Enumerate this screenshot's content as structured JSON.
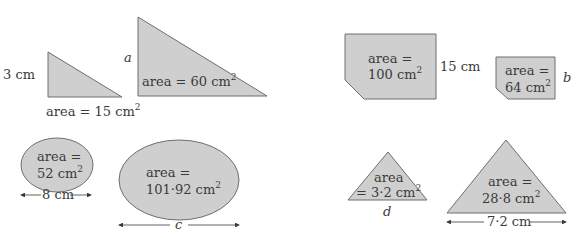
{
  "colors": {
    "fill": "#cfcfcf",
    "stroke": "#6e6e6e",
    "text": "#3a3a3a"
  },
  "shapes": {
    "tri_small": {
      "side_label": "3 cm",
      "area_label": "area = 15 cm",
      "sup": "2"
    },
    "tri_large": {
      "side_label": "a",
      "area_label": "area = 60 cm",
      "sup": "2"
    },
    "hex_large": {
      "area_line1": "area =",
      "area_line2": "100 cm",
      "sup": "2",
      "side_label": "15 cm"
    },
    "hex_small": {
      "area_line1": "area =",
      "area_line2": "64 cm",
      "sup": "2",
      "side_label": "b"
    },
    "ellipse_small": {
      "area_line1": "area =",
      "area_line2": "52 cm",
      "sup": "2",
      "width_label": "8 cm"
    },
    "ellipse_large": {
      "area_line1": "area =",
      "area_line2": "101·92 cm",
      "sup": "2",
      "width_label": "c"
    },
    "tri_iso_small": {
      "area_line1": "area",
      "area_line2": "= 3·2 cm",
      "sup": "2",
      "base_label": "d"
    },
    "tri_iso_large": {
      "area_line1": "area =",
      "area_line2": "28·8 cm",
      "sup": "2",
      "base_label": "7·2 cm"
    }
  }
}
